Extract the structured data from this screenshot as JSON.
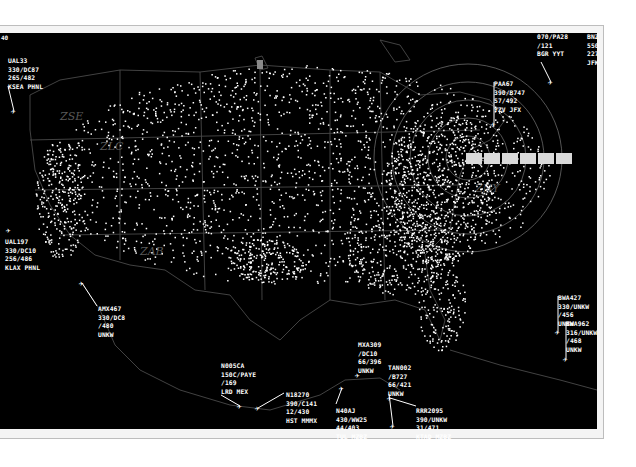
{
  "display": {
    "title": "Air Traffic Radar Display",
    "background": "#000000",
    "frame_color": "#bdbdbd",
    "corner_label": "40",
    "sector_labels": [
      "ZSE",
      "ZLC",
      "ZAB",
      "ZNY"
    ],
    "fix_strip": {
      "cells": 6,
      "color": "#d9d9d9"
    }
  },
  "flights": [
    {
      "id": "UAL33",
      "lines": [
        "UAL33",
        "330/DC87",
        "265/482",
        "KSEA PHNL"
      ],
      "x": 8,
      "y": 57,
      "ax": 14,
      "ay": 111,
      "lx": 8,
      "ly": 86
    },
    {
      "id": "PAA67",
      "lines": [
        "PAA67",
        "390/B747",
        "57/492",
        "YZV JFX"
      ],
      "x": 494,
      "y": 80,
      "ax": 494,
      "ay": 124,
      "lx": 494,
      "ly": 82
    },
    {
      "id": "CLIPPED_NE",
      "lines": [
        "",
        "070/PA28",
        "/121",
        "BGR YYT"
      ],
      "x": 537,
      "y": 33,
      "ax": 551,
      "ay": 82,
      "lx": 541,
      "ly": 62
    },
    {
      "id": "EDGE_NE",
      "lines": [
        "BNZ",
        "550",
        "227",
        "JFK"
      ],
      "x": 587,
      "y": 33,
      "ax": 0,
      "ay": 0,
      "lx": 0,
      "ly": 0
    },
    {
      "id": "UAL197",
      "lines": [
        "UAL197",
        "330/DC10",
        "256/486",
        "KLAX PHNL"
      ],
      "x": 5,
      "y": 238,
      "ax": 9,
      "ay": 230,
      "lx": 9,
      "ly": 230
    },
    {
      "id": "AMX467",
      "lines": [
        "AMX467",
        "330/DC8",
        "/480",
        "UNKW"
      ],
      "x": 98,
      "y": 305,
      "ax": 82,
      "ay": 283,
      "lx": 97,
      "ly": 306
    },
    {
      "id": "N005CA",
      "lines": [
        "N005CA",
        "150C/PAYE",
        "/169",
        "LRD MEX"
      ],
      "x": 221,
      "y": 362,
      "ax": 240,
      "ay": 406,
      "lx": 221,
      "ly": 395
    },
    {
      "id": "N18270",
      "lines": [
        "N18270",
        "390/C141",
        "12/430",
        "HST MMMX"
      ],
      "x": 286,
      "y": 391,
      "ax": 258,
      "ay": 408,
      "lx": 284,
      "ly": 393
    },
    {
      "id": "MXA309",
      "lines": [
        "MXA309",
        "/DC10",
        "66/396",
        "UNKW"
      ],
      "x": 358,
      "y": 341,
      "ax": 358,
      "ay": 375,
      "lx": 358,
      "ly": 375
    },
    {
      "id": "TAN002",
      "lines": [
        "TAN002",
        "/B727",
        "66/421",
        "UNKW"
      ],
      "x": 388,
      "y": 364,
      "ax": 393,
      "ay": 426,
      "lx": 389,
      "ly": 394
    },
    {
      "id": "N40AJ",
      "lines": [
        "N40AJ",
        "430/WW25",
        "44/403",
        "TUL MZBZ"
      ],
      "x": 336,
      "y": 407,
      "ax": 342,
      "ay": 388,
      "lx": 336,
      "ly": 404
    },
    {
      "id": "RRR2095",
      "lines": [
        "RRR2095",
        "390/UNKW",
        "31/471",
        "KTAD MZBZ"
      ],
      "x": 416,
      "y": 407,
      "ax": 390,
      "ay": 398,
      "lx": 416,
      "ly": 406
    },
    {
      "id": "BWA427",
      "lines": [
        "BWA427",
        "330/UNKW",
        "/456",
        "UNKW"
      ],
      "x": 558,
      "y": 294,
      "ax": 558,
      "ay": 332,
      "lx": 558,
      "ly": 296
    },
    {
      "id": "BWA962",
      "lines": [
        "BWA962",
        "316/UNKW",
        "/468",
        "UNKW"
      ],
      "x": 566,
      "y": 320,
      "ax": 566,
      "ay": 359,
      "lx": 566,
      "ly": 322
    }
  ],
  "traffic_field": {
    "dot_color": "#ffffff",
    "seed": 7,
    "clusters": [
      {
        "cx": 300,
        "cy": 175,
        "rx": 250,
        "ry": 110,
        "n": 1900
      },
      {
        "cx": 440,
        "cy": 185,
        "rx": 55,
        "ry": 75,
        "n": 650
      },
      {
        "cx": 60,
        "cy": 200,
        "rx": 25,
        "ry": 60,
        "n": 260
      },
      {
        "cx": 265,
        "cy": 260,
        "rx": 40,
        "ry": 22,
        "n": 180
      },
      {
        "cx": 400,
        "cy": 250,
        "rx": 60,
        "ry": 45,
        "n": 300
      },
      {
        "cx": 440,
        "cy": 300,
        "rx": 25,
        "ry": 50,
        "n": 160
      }
    ]
  }
}
